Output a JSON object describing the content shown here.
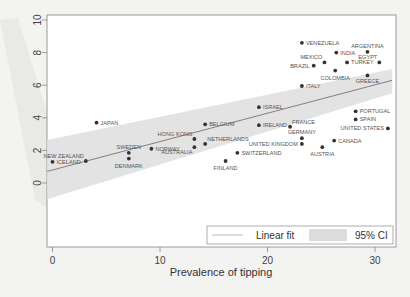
{
  "chart_data": {
    "type": "scatter",
    "title": "",
    "xlabel": "Prevalence of tipping",
    "ylabel": "",
    "xlim": [
      -0.5,
      32
    ],
    "ylim": [
      -4,
      10.3
    ],
    "x_ticks": [
      0,
      10,
      20,
      30
    ],
    "y_ticks": [
      0,
      2,
      4,
      6,
      8,
      10
    ],
    "grid": false,
    "legend": {
      "position": "bottom-right inside",
      "entries": [
        {
          "label": "Linear fit",
          "kind": "line",
          "color": "#666666"
        },
        {
          "label": "95% CI",
          "kind": "band",
          "color": "#dcdcdc"
        }
      ]
    },
    "fit": {
      "x": [
        0,
        31.6
      ],
      "y": [
        0.8,
        6.3
      ],
      "ci_lower": [
        -0.9,
        5.5
      ],
      "ci_upper": [
        2.7,
        7.0
      ]
    },
    "points": [
      {
        "label": "ICELAND",
        "x": 0.0,
        "y": 1.3
      },
      {
        "label": "NEW ZEALAND",
        "x": 3.1,
        "y": 1.35
      },
      {
        "label": "JAPAN",
        "x": 4.1,
        "y": 3.7
      },
      {
        "label": "SWEDEN",
        "x": 7.1,
        "y": 1.85
      },
      {
        "label": "DENMARK",
        "x": 7.1,
        "y": 1.5
      },
      {
        "label": "NORWAY",
        "x": 9.2,
        "y": 2.1
      },
      {
        "label": "HONG KONG",
        "x": 13.2,
        "y": 2.7
      },
      {
        "label": "AUSTRALIA",
        "x": 13.2,
        "y": 2.2
      },
      {
        "label": "NETHERLANDS",
        "x": 14.2,
        "y": 2.4
      },
      {
        "label": "BELGIUM",
        "x": 14.2,
        "y": 3.6
      },
      {
        "label": "FINLAND",
        "x": 16.1,
        "y": 1.35
      },
      {
        "label": "SWITZERLAND",
        "x": 17.2,
        "y": 1.85
      },
      {
        "label": "ISRAEL",
        "x": 19.2,
        "y": 4.65
      },
      {
        "label": "IRELAND",
        "x": 19.2,
        "y": 3.55
      },
      {
        "label": "FRANCE",
        "x": 22.1,
        "y": 3.45
      },
      {
        "label": "ITALY",
        "x": 23.2,
        "y": 5.95
      },
      {
        "label": "VENEZUELA",
        "x": 23.2,
        "y": 8.6
      },
      {
        "label": "GERMANY",
        "x": 23.2,
        "y": 2.75
      },
      {
        "label": "UNITED KINGDOM",
        "x": 23.2,
        "y": 2.4
      },
      {
        "label": "BRAZIL",
        "x": 24.3,
        "y": 7.2
      },
      {
        "label": "MEXICO",
        "x": 25.3,
        "y": 7.4
      },
      {
        "label": "AUSTRIA",
        "x": 25.1,
        "y": 2.2
      },
      {
        "label": "COLOMBIA",
        "x": 26.3,
        "y": 6.9
      },
      {
        "label": "INDIA",
        "x": 26.4,
        "y": 8.0
      },
      {
        "label": "CANADA",
        "x": 26.2,
        "y": 2.6
      },
      {
        "label": "TURKEY",
        "x": 27.4,
        "y": 7.4
      },
      {
        "label": "PORTUGAL",
        "x": 28.2,
        "y": 4.4
      },
      {
        "label": "SPAIN",
        "x": 28.2,
        "y": 3.9
      },
      {
        "label": "ARGENTINA",
        "x": 29.3,
        "y": 8.05
      },
      {
        "label": "GREECE",
        "x": 29.3,
        "y": 6.6
      },
      {
        "label": "EGYPT",
        "x": 30.4,
        "y": 7.4
      },
      {
        "label": "UNITED STATES",
        "x": 31.2,
        "y": 3.35
      }
    ]
  },
  "label_placement": {
    "ICELAND": "right",
    "NEW ZEALAND": "above-left",
    "JAPAN": "right",
    "SWEDEN": "above",
    "DENMARK": "below",
    "NORWAY": "right",
    "HONG KONG": "above-left",
    "AUSTRALIA": "below-left",
    "NETHERLANDS": "above-right",
    "BELGIUM": "right",
    "FINLAND": "below",
    "SWITZERLAND": "right",
    "ISRAEL": "right",
    "IRELAND": "right",
    "FRANCE": "above-right",
    "ITALY": "right",
    "VENEZUELA": "right",
    "GERMANY": "above",
    "UNITED KINGDOM": "left",
    "BRAZIL": "left",
    "MEXICO": "above-left",
    "AUSTRIA": "below",
    "COLOMBIA": "below",
    "INDIA": "right",
    "CANADA": "right",
    "TURKEY": "right",
    "PORTUGAL": "right",
    "SPAIN": "right",
    "ARGENTINA": "above",
    "GREECE": "below-above",
    "EGYPT": "above-left",
    "UNITED STATES": "left"
  }
}
